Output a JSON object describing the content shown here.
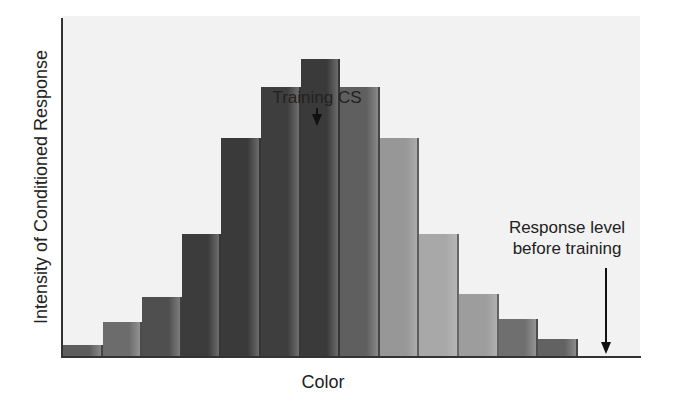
{
  "chart_data": {
    "type": "bar",
    "title": "",
    "xlabel": "Color",
    "ylabel": "Intensity of Conditioned Response",
    "categories": [
      "1",
      "2",
      "3",
      "4",
      "5",
      "6",
      "7",
      "8",
      "9",
      "10",
      "11",
      "12",
      "13"
    ],
    "values": [
      4,
      12,
      21,
      43,
      77,
      95,
      105,
      95,
      77,
      43,
      22,
      13,
      6
    ],
    "ylim": [
      0,
      120
    ],
    "grid": false,
    "legend": null,
    "bar_colors": [
      "#9a9a9a",
      "#a6a6a6",
      "#8e8e8e",
      "#7c7c7c",
      "#7a7a7a",
      "#7e7e7e",
      "#7a7a7a",
      "#9c9c9c",
      "#c4c4c4",
      "#cfcfcf",
      "#c8c8c8",
      "#a8a8a8",
      "#9e9e9e"
    ],
    "annotations": [
      {
        "text": "Training CS",
        "target_category": "7",
        "arrow": "down"
      },
      {
        "text": "Response level before training",
        "line1": "Response level",
        "line2": "before training",
        "arrow": "down",
        "points_to": "baseline (0)"
      }
    ]
  },
  "labels": {
    "y_axis": "Intensity of Conditioned Response",
    "x_axis": "Color",
    "training_cs": "Training CS",
    "baseline_line1": "Response level",
    "baseline_line2": "before training"
  }
}
